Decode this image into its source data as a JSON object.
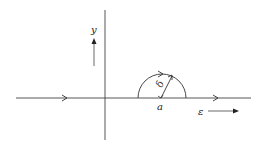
{
  "diagram": {
    "type": "contour-indentation",
    "labels": {
      "y_axis": "y",
      "point": "a",
      "radius": "δ",
      "direction": "ε"
    },
    "colors": {
      "line": "#333333",
      "background": "#ffffff"
    }
  }
}
